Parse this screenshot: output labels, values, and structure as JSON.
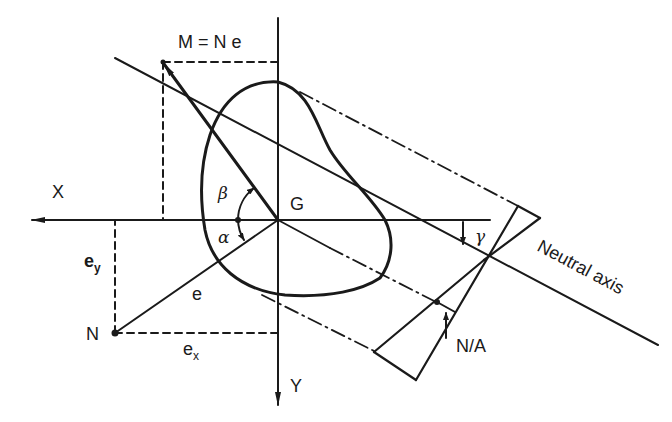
{
  "figure": {
    "colors": {
      "ink": "#1a1a1a",
      "background": "#ffffff"
    }
  },
  "labels": {
    "moment": "M = N e",
    "x_axis": "X",
    "y_axis": "Y",
    "centroid": "G",
    "beta": "β",
    "alpha": "α",
    "gamma": "γ",
    "ey_main": "e",
    "ey_sub": "y",
    "ex_main": "e",
    "ex_sub": "x",
    "e": "e",
    "force_point": "N",
    "neutral_axis": "Neutral axis",
    "stress": "N/A"
  }
}
